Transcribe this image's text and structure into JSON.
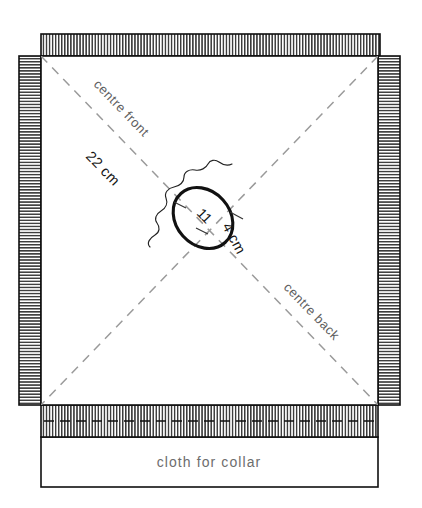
{
  "diagram": {
    "title": "cloth for collar",
    "type": "sewing-cutting-layout",
    "labels": {
      "centre_front": "centre front",
      "centre_back": "centre back",
      "dimension_diagonal": "22 cm",
      "neck_width": "11",
      "neck_depth": "4 cm",
      "collar_caption": "cloth for collar"
    },
    "colors": {
      "ink": "#0f0f0f",
      "dash_guide": "#9a9a9a",
      "label_gray": "#5e5e5e",
      "paper": "#ffffff"
    },
    "measurements": [
      {
        "name": "centre-front-half-diagonal",
        "value": "22 cm"
      },
      {
        "name": "neck-opening-width",
        "value": "11"
      },
      {
        "name": "neck-opening-depth",
        "value": "4 cm"
      }
    ],
    "regions": [
      {
        "name": "main-fabric-square",
        "note": "main body panel"
      },
      {
        "name": "selvedge-top",
        "note": "hatched edge band"
      },
      {
        "name": "selvedge-right",
        "note": "hatched edge band"
      },
      {
        "name": "selvedge-left",
        "note": "hatched edge band"
      },
      {
        "name": "collar-strip-hatched",
        "note": "hatched collar strip"
      },
      {
        "name": "collar-cloth-panel",
        "note": "cloth for collar"
      }
    ]
  }
}
